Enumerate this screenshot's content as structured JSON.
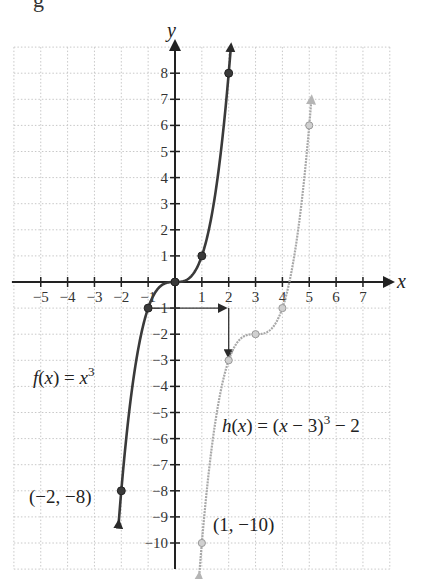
{
  "page_fragment": "g",
  "chart_data": {
    "type": "line",
    "title": "",
    "xlabel": "x",
    "ylabel": "y",
    "xlim": [
      -6,
      8
    ],
    "ylim": [
      -11,
      9
    ],
    "grid": true,
    "grid_style": "dotted",
    "x_ticks": [
      -5,
      -4,
      -3,
      -2,
      -1,
      1,
      2,
      3,
      4,
      5,
      6,
      7
    ],
    "y_ticks": [
      -10,
      -9,
      -8,
      -7,
      -6,
      -5,
      -4,
      -3,
      -2,
      -1,
      1,
      2,
      3,
      4,
      5,
      6,
      7,
      8
    ],
    "x_tick_labels": [
      "−5",
      "−4",
      "−3",
      "−2",
      "−1",
      "1",
      "2",
      "3",
      "4",
      "5",
      "6",
      "7"
    ],
    "y_tick_labels": [
      "−10",
      "−9",
      "−8",
      "−7",
      "−6",
      "−5",
      "−4",
      "−3",
      "−2",
      "−1",
      "1",
      "2",
      "3",
      "4",
      "5",
      "6",
      "7",
      "8"
    ],
    "series": [
      {
        "name": "f(x) = x^3",
        "label": "f(x) = x",
        "label_sup": "3",
        "color": "#3a3a3a",
        "domain": [
          -2.1,
          2.08
        ],
        "points": [
          [
            -2,
            -8
          ],
          [
            -1,
            -1
          ],
          [
            0,
            0
          ],
          [
            1,
            1
          ],
          [
            2,
            8
          ]
        ]
      },
      {
        "name": "h(x) = (x − 3)^3 − 2",
        "label_pre": "h(x) = (x − 3)",
        "label_sup": "3",
        "label_post": " − 2",
        "color": "#a8a8a8",
        "domain": [
          0.9,
          5.08
        ],
        "points": [
          [
            1,
            -10
          ],
          [
            2,
            -3
          ],
          [
            3,
            -2
          ],
          [
            4,
            -1
          ],
          [
            5,
            6
          ]
        ]
      }
    ],
    "annotations": [
      {
        "text": "(−2, −8)",
        "x": -2,
        "y": -8
      },
      {
        "text": "(1, −10)",
        "x": 1,
        "y": -10
      },
      {
        "type": "arrow-path",
        "from": [
          -1,
          -1
        ],
        "via": [
          2,
          -1
        ],
        "to": [
          2,
          -3
        ],
        "meaning": "shift right 3, down 2"
      }
    ],
    "legend": "none (inline labels)"
  }
}
